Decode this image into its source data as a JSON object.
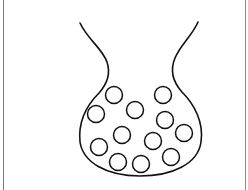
{
  "diagram": {
    "subject": "flask-shaped vessel containing particles",
    "stroke_color": "#111111",
    "background_color": "#ffffff",
    "border_color": "#7a7a7a",
    "vessel": {
      "shape": "round-bottom flask outline with flared neck",
      "top_left": [
        80,
        23
      ],
      "top_right": [
        198,
        22
      ],
      "bottom_y": 176
    },
    "particles": {
      "count": 12,
      "radius": 8.5,
      "centers": [
        [
          114,
          95
        ],
        [
          163,
          95
        ],
        [
          96,
          114
        ],
        [
          135,
          110
        ],
        [
          165,
          120
        ],
        [
          122,
          135
        ],
        [
          184,
          133
        ],
        [
          153,
          141
        ],
        [
          99,
          147
        ],
        [
          171,
          157
        ],
        [
          118,
          162
        ],
        [
          141,
          164
        ]
      ]
    }
  }
}
